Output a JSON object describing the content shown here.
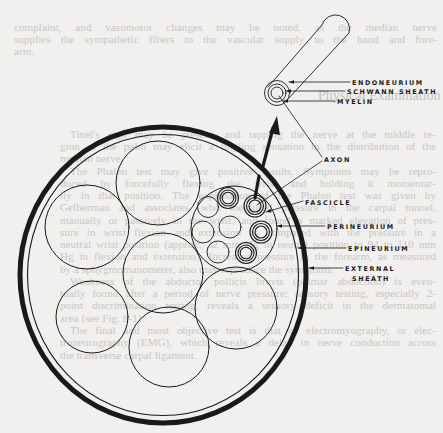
{
  "figure": {
    "type": "nerve cross-section diagram",
    "labels": {
      "endoneurium": "ENDONEURIUM",
      "schwann_sheath": "SCHWANN SHEATH",
      "myelin": "MYELIN",
      "axon": "AXON",
      "fascicle": "FASCICLE",
      "perineurium": "PERINEURIUM",
      "epineurium": "EPINEURIUM",
      "external_sheath_line1": "EXTERNAL",
      "external_sheath_line2": "SHEATH"
    },
    "colors": {
      "ink": "#1a1a1a",
      "paper": "#f1f0ee",
      "show_through_text": "#c9c7c4"
    }
  },
  "background_text": {
    "top_lines": [
      "complaint, and vasomotor changes may be noted, as the median nerve",
      "supplies the sympathetic fibers to the vascular supply to the hand and fore-",
      "arm."
    ],
    "heading": "Physical Examination",
    "body_lines": [
      "Tinel's sign may be present, and tapping the nerve at the middle re-",
      "gion of the palm may elicit a tingling sensation in the distribution of the",
      "median nerve.",
      "The Phalen test may give positive results. Symptoms may be repro-",
      "duced by forcefully flexing the wrist and holding it momentar-",
      "ily in that position. The explanation of the Phalen test was given by",
      "Gelberman and associates, who measured pressure in the carpal tunnel,",
      "manually or passively in the wrist, and found a marked elevation of pres-",
      "sure in wrist flexion and extension as compared with the pressure in a",
      "neutral wrist position (approx. 32 mm Hg in neutral position to 94 to 110 mm",
      "Hg in flexion and extension). Increased pressure in the forearm, as measured",
      "by a sphygmomanometer, also may reproduce the symptoms.",
      "Weakness of the abductor pollicis brevis (palmar abduction) is even-",
      "tually found after a period of nerve pressure; sensory testing, especially 2-",
      "point discrimination testing, reveals a sensory deficit in the dermatomal",
      "area (see Fig. 8-1).",
      "The final and most objective test is that of electromyography, or elec-",
      "troneurography (EMG), which reveals a delay in nerve conduction across",
      "the transverse carpal ligament."
    ]
  }
}
